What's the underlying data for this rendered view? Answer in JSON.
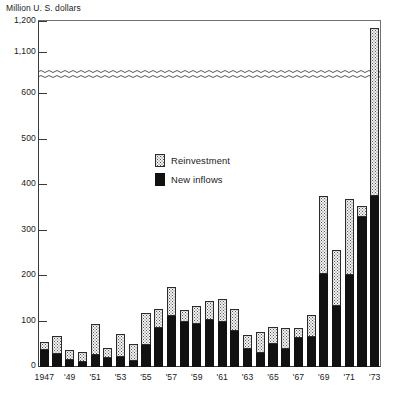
{
  "chart_data": {
    "type": "bar",
    "stacked": true,
    "title": "",
    "ylabel": "Million U. S. dollars",
    "xlabel": "",
    "grid": false,
    "legend_position": "inside-center",
    "axis_break": {
      "from": 600,
      "to": 1100,
      "label": "wavy-break"
    },
    "ylim": [
      0,
      1200
    ],
    "yticks": [
      0,
      100,
      200,
      300,
      400,
      500,
      600,
      1100,
      1200
    ],
    "ytick_labels": [
      "0",
      "100",
      "200",
      "300",
      "400",
      "500",
      "600",
      "1,100",
      "1,200"
    ],
    "categories": [
      1947,
      1948,
      1949,
      1950,
      1951,
      1952,
      1953,
      1954,
      1955,
      1956,
      1957,
      1958,
      1959,
      1960,
      1961,
      1962,
      1963,
      1964,
      1965,
      1966,
      1967,
      1968,
      1969,
      1970,
      1971,
      1972,
      1973
    ],
    "xtick_labels": [
      "1947",
      "",
      "'49",
      "",
      "'51",
      "",
      "'53",
      "",
      "'55",
      "",
      "'57",
      "",
      "'59",
      "",
      "'61",
      "",
      "'63",
      "",
      "'65",
      "",
      "'67",
      "",
      "'69",
      "",
      "'71",
      "",
      "'73"
    ],
    "series": [
      {
        "name": "New inflows",
        "color": "#111111",
        "values": [
          38,
          28,
          15,
          12,
          26,
          20,
          21,
          13,
          48,
          85,
          113,
          98,
          94,
          103,
          98,
          80,
          40,
          31,
          50,
          40,
          63,
          66,
          205,
          135,
          203,
          330,
          640
        ]
      },
      {
        "name": "Reinvestment",
        "color": "#f2f2f2",
        "values": [
          18,
          40,
          22,
          21,
          68,
          22,
          52,
          37,
          70,
          42,
          62,
          28,
          40,
          43,
          51,
          47,
          30,
          46,
          38,
          45,
          22,
          49,
          170,
          122,
          167,
          275,
          540
        ]
      }
    ],
    "totals": [
      56,
      68,
      37,
      33,
      94,
      42,
      73,
      50,
      118,
      127,
      175,
      126,
      134,
      146,
      149,
      127,
      70,
      77,
      88,
      85,
      85,
      115,
      375,
      257,
      370,
      605,
      1180
    ],
    "annotations": []
  },
  "legend": {
    "items": [
      {
        "label": "Reinvestment",
        "swatch": "stippled"
      },
      {
        "label": "New inflows",
        "swatch": "solid-black"
      }
    ]
  },
  "axis": {
    "y_title": "Million U. S. dollars"
  }
}
